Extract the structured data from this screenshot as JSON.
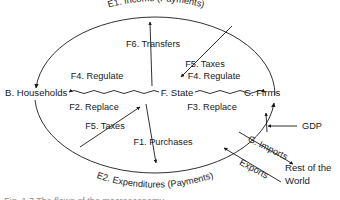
{
  "diagram": {
    "type": "circular-flow",
    "stroke_color": "#1a1a1a",
    "text_color": "#1a1a1a",
    "background": "#ffffff"
  },
  "nodes": [
    {
      "id": "households",
      "label": "B. Households"
    },
    {
      "id": "firms",
      "label": "C. Firms"
    },
    {
      "id": "state",
      "label": "F. State"
    },
    {
      "id": "row",
      "label_line1": "Rest of the",
      "label_line2": "World"
    }
  ],
  "flows": {
    "income": "E1. Income (Payments)",
    "expenditures": "E2. Expenditures (Payments)",
    "transfers": "F6. Transfers",
    "taxes_firms": "F5. Taxes",
    "taxes_households": "F5. Taxes",
    "regulate_households": "F4. Regulate",
    "regulate_firms": "F4. Regulate",
    "replace_households": "F2. Replace",
    "replace_firms": "F3. Replace",
    "purchases": "F1. Purchases",
    "gdp": "GDP",
    "imports": "G. Imports",
    "exports": "Exports"
  },
  "caption": {
    "text": "Fig. 1.7  The flows of the macroeconomy"
  }
}
